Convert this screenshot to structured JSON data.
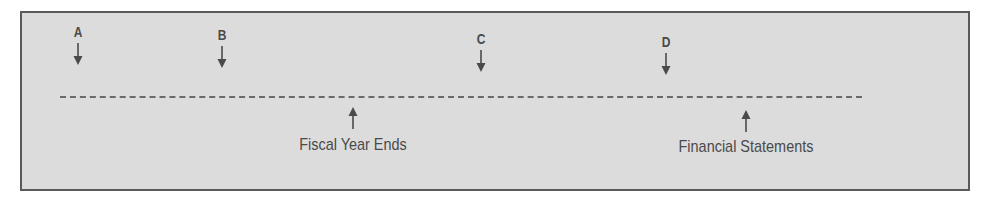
{
  "diagram": {
    "type": "timeline",
    "markers": [
      {
        "letter": "A",
        "x": 78,
        "top": 24
      },
      {
        "letter": "B",
        "x": 222,
        "top": 27
      },
      {
        "letter": "C",
        "x": 481,
        "top": 31
      },
      {
        "letter": "D",
        "x": 666,
        "top": 34
      }
    ],
    "events": [
      {
        "label": "Fiscal Year Ends",
        "x": 353
      },
      {
        "label": "Financial Statements",
        "x": 746
      }
    ],
    "colors": {
      "background": "#dcdcdc",
      "border": "#5a5a5a",
      "ink": "#4a4a4a",
      "dash": "#6a6a6a"
    }
  }
}
